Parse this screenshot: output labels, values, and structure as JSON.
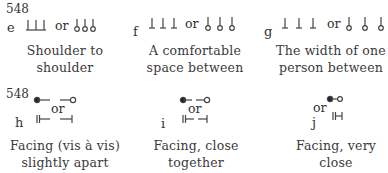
{
  "page_number": "548",
  "top_row": [
    {
      "letter": "e",
      "or": "or",
      "caption_line1": "Shoulder to",
      "caption_line2": "shoulder",
      "symbol_left": "three-standing-pins",
      "symbol_right": "three-pins-with-circles"
    },
    {
      "letter": "f",
      "or": "or",
      "caption_line1": "A comfortable",
      "caption_line2": "space between",
      "symbol_left": "three-standing-pins-spaced",
      "symbol_right": "three-pins-with-circles-spaced"
    },
    {
      "letter": "g",
      "or": "or",
      "caption_line1": "The width of one",
      "caption_line2": "person between",
      "symbol_left": "three-standing-pins-wide",
      "symbol_right": "three-pins-with-circles-wide"
    }
  ],
  "bottom_row": [
    {
      "page_number": "548",
      "letter": "h",
      "or": "or",
      "caption_line1": "Facing (vis à vis)",
      "caption_line2": "slightly apart",
      "symbol_top": "filled-dot-and-open-circle-facing",
      "symbol_bottom": "double-bar-and-bar-facing"
    },
    {
      "letter": "i",
      "or": "or",
      "caption_line1": "Facing, close",
      "caption_line2": "together",
      "symbol_top": "filled-dot-and-open-circle-close",
      "symbol_bottom": "double-bar-and-bar-close"
    },
    {
      "letter": "j",
      "or": "or",
      "caption_line1": "Facing, very",
      "caption_line2": "close",
      "symbol_top": "filled-dot-and-open-circle-very-close",
      "symbol_bottom": "double-bar-and-bar-very-close"
    }
  ]
}
